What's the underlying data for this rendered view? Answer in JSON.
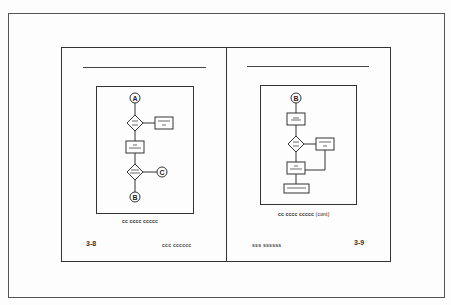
{
  "spread": {
    "left_page": {
      "page_number": "3-8",
      "footer_text": "ccc cccccc",
      "caption": "cc cccc ccccc",
      "flowchart": {
        "connectors": [
          "A",
          "C",
          "B"
        ],
        "nodes": [
          {
            "id": "A",
            "type": "connector",
            "label": "A"
          },
          {
            "id": "d1",
            "type": "decision",
            "label": ""
          },
          {
            "id": "p1",
            "type": "process",
            "label": ""
          },
          {
            "id": "p2",
            "type": "process",
            "label": ""
          },
          {
            "id": "d2",
            "type": "decision",
            "label": ""
          },
          {
            "id": "C",
            "type": "connector",
            "label": "C"
          },
          {
            "id": "B",
            "type": "connector",
            "label": "B"
          }
        ]
      }
    },
    "right_page": {
      "page_number": "3-9",
      "footer_text": "sss ssssss",
      "caption": "cc cccc ccccc",
      "caption_suffix": "(cont)",
      "flowchart": {
        "nodes": [
          {
            "id": "B",
            "type": "connector",
            "label": "B"
          },
          {
            "id": "p1",
            "type": "process",
            "label": ""
          },
          {
            "id": "d1",
            "type": "decision",
            "label": ""
          },
          {
            "id": "p2",
            "type": "process",
            "label": ""
          },
          {
            "id": "p3",
            "type": "process",
            "label": ""
          },
          {
            "id": "p4",
            "type": "process",
            "label": ""
          }
        ]
      }
    }
  }
}
